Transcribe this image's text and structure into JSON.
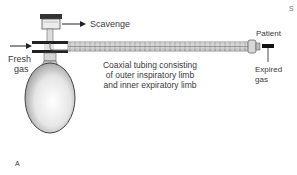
{
  "figure": {
    "panel_label": "A",
    "corner_mark": "S",
    "labels": {
      "scavenge": "Scavenge",
      "fresh_gas_line1": "Fresh",
      "fresh_gas_line2": "gas",
      "patient": "Patient",
      "expired_gas_line1": "Expired",
      "expired_gas_line2": "gas",
      "tubing_line1": "Coaxial tubing consisting",
      "tubing_line2": "of outer inspiratory limb",
      "tubing_line3": "and inner expiratory limb"
    }
  }
}
